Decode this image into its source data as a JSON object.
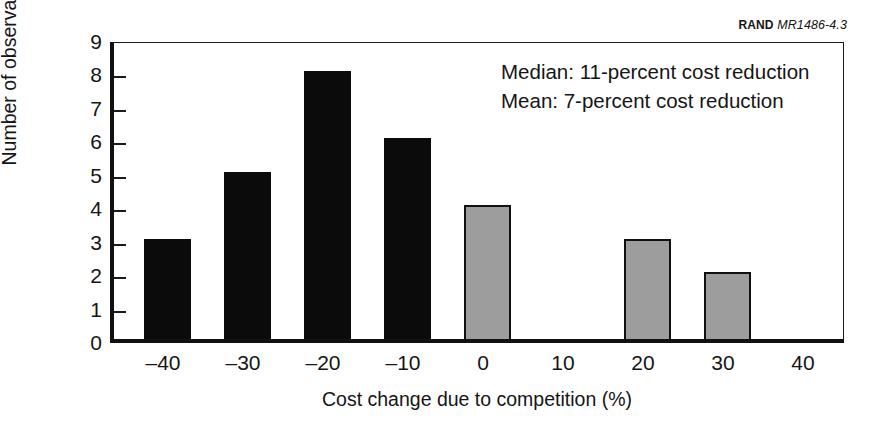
{
  "credit": {
    "organization": "RAND",
    "document_id": "MR1486-4.3"
  },
  "annotation": {
    "median_line": "Median:  11-percent cost reduction",
    "mean_line": "Mean:  7-percent cost reduction"
  },
  "axes": {
    "y_title": "Number of observations",
    "x_title": "Cost change due to competition (%)",
    "y_ticks": [
      "0",
      "1",
      "2",
      "3",
      "4",
      "5",
      "6",
      "7",
      "8",
      "9"
    ],
    "x_ticks": [
      "–40",
      "–30",
      "–20",
      "–10",
      "0",
      "10",
      "20",
      "30",
      "40"
    ]
  },
  "colors": {
    "bar_reduction": "#0b0b0b",
    "bar_increase": "#9d9d9d",
    "bar_outline": "#101010",
    "axis": "#111111",
    "background": "#ffffff"
  },
  "chart_data": {
    "type": "bar",
    "title": "",
    "subtitle": "",
    "xlabel": "Cost change due to competition (%)",
    "ylabel": "Number of observations",
    "categories": [
      "–40",
      "–30",
      "–20",
      "–10",
      "0",
      "10",
      "20",
      "30"
    ],
    "x": [
      -40,
      -30,
      -20,
      -10,
      0,
      10,
      20,
      30
    ],
    "values": [
      3,
      5,
      8,
      6,
      4,
      0,
      3,
      2
    ],
    "bar_colors": [
      "#0b0b0b",
      "#0b0b0b",
      "#0b0b0b",
      "#0b0b0b",
      "#9d9d9d",
      "#9d9d9d",
      "#9d9d9d",
      "#9d9d9d"
    ],
    "xlim": [
      -45,
      45
    ],
    "ylim": [
      0,
      9
    ],
    "x_tick_values": [
      -40,
      -30,
      -20,
      -10,
      0,
      10,
      20,
      30,
      40
    ],
    "y_tick_values": [
      0,
      1,
      2,
      3,
      4,
      5,
      6,
      7,
      8,
      9
    ],
    "grid": false,
    "legend": false,
    "annotations": [
      "Median:  11-percent cost reduction",
      "Mean:  7-percent cost reduction"
    ],
    "total_observations": 31
  }
}
